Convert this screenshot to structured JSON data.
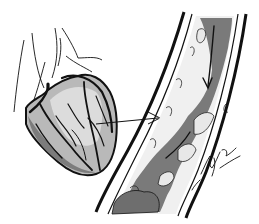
{
  "illustration": {
    "subject": "Heart with coronary arteries and magnified artery cross-section",
    "colors": {
      "background": "#ffffff",
      "ink": "#111111",
      "heart_light": "#d8d8d8",
      "heart_mid": "#a8a8a8",
      "heart_dark": "#6e6e6e",
      "artery_lumen": "#7a7a7a",
      "artery_plaque": "#f2f2f2"
    },
    "signature": "artist signature (illegible)"
  }
}
